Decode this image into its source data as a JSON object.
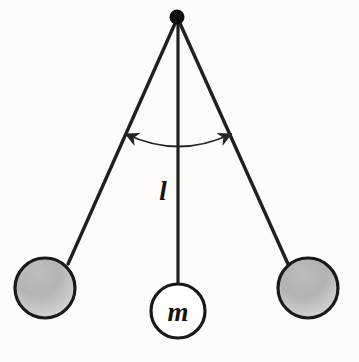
{
  "figure": {
    "name": "simple-pendulum-diagram",
    "type": "physics-diagram",
    "background_color": "#fdfcfb"
  },
  "labels": {
    "length_label": "l",
    "mass_label": "m"
  },
  "colors": {
    "string": "#241f1b",
    "pivot": "#100d0b",
    "bob_outline": "#1c1815",
    "bob_fill_gray_top": "#a9a9a9",
    "bob_fill_gray_bottom": "#d6d6d6",
    "bob_fill_white": "#ffffff",
    "arc_arrow": "#2a2420",
    "text": "#16120f"
  },
  "geometry": {
    "pivot": {
      "x": 177,
      "y": 17,
      "r": 7
    },
    "strings": [
      {
        "name": "left-string",
        "x1": 177,
        "y1": 19,
        "x2": 68,
        "y2": 264,
        "width": 3.4
      },
      {
        "name": "center-string",
        "x1": 178,
        "y1": 19,
        "x2": 178,
        "y2": 285,
        "width": 3.2
      },
      {
        "name": "right-string",
        "x1": 178,
        "y1": 19,
        "x2": 288,
        "y2": 264,
        "width": 3.4
      }
    ],
    "bobs": [
      {
        "name": "left-bob",
        "cx": 45,
        "cy": 288,
        "r": 30,
        "fill": "gray"
      },
      {
        "name": "center-bob",
        "cx": 178,
        "cy": 311,
        "r": 27,
        "fill": "white"
      },
      {
        "name": "right-bob",
        "cx": 308,
        "cy": 288,
        "r": 30,
        "fill": "gray"
      }
    ],
    "arc_arrow": {
      "name": "swing-angle-arc",
      "start": {
        "x": 124,
        "y": 133
      },
      "end": {
        "x": 233,
        "y": 133
      },
      "sag_y": 153,
      "double_headed": true
    },
    "length_label_pos": {
      "x": 162,
      "y": 199
    },
    "mass_label_pos": {
      "x": 178,
      "y": 320
    }
  }
}
